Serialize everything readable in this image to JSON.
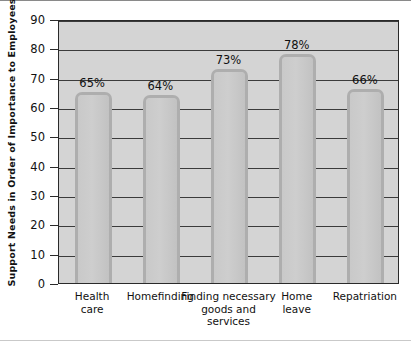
{
  "chart_data": {
    "type": "bar",
    "title": "",
    "xlabel": "",
    "ylabel": "Support Needs in Order of Importance to Employees",
    "ylim": [
      0,
      90
    ],
    "ytick_step": 10,
    "yticks": [
      90,
      80,
      70,
      60,
      50,
      40,
      30,
      20,
      10,
      0
    ],
    "grid": true,
    "legend": "none",
    "categories": [
      "Health care",
      "Homefinding",
      "Finding necessary goods and services",
      "Home leave",
      "Repatriation"
    ],
    "category_lines": [
      [
        "Health",
        "care"
      ],
      [
        "Homefinding"
      ],
      [
        "Finding necessary",
        "goods and",
        "services"
      ],
      [
        "Home",
        "leave"
      ],
      [
        "Repatriation"
      ]
    ],
    "values": [
      65,
      64,
      73,
      78,
      66
    ],
    "data_labels": [
      "65%",
      "64%",
      "73%",
      "78%",
      "66%"
    ],
    "colors": {
      "bar_fill": "#c6c6c6",
      "bar_edge": "#aeaeae",
      "plot_background": "#d4d4d4",
      "gridline": "#3b3b3b",
      "axis": "#2a2a2a",
      "text": "#111111",
      "figure_background": "#ffffff"
    }
  }
}
